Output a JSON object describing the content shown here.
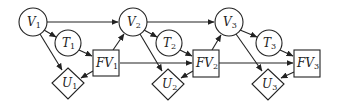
{
  "diagram": {
    "type": "dynamic-decision-network",
    "nodes": [
      {
        "id": "V1",
        "label": "V",
        "sub": "1",
        "shape": "circle",
        "x": 33,
        "y": 22
      },
      {
        "id": "T1",
        "label": "T",
        "sub": "1",
        "shape": "circle",
        "x": 68,
        "y": 43
      },
      {
        "id": "FV1",
        "label": "FV",
        "sub": "1",
        "shape": "square",
        "x": 106,
        "y": 63
      },
      {
        "id": "U1",
        "label": "U",
        "sub": "1",
        "shape": "diamond",
        "x": 68,
        "y": 83
      },
      {
        "id": "V2",
        "label": "V",
        "sub": "2",
        "shape": "circle",
        "x": 133,
        "y": 22
      },
      {
        "id": "T2",
        "label": "T",
        "sub": "2",
        "shape": "circle",
        "x": 169,
        "y": 43
      },
      {
        "id": "FV2",
        "label": "FV",
        "sub": "2",
        "shape": "square",
        "x": 205,
        "y": 63
      },
      {
        "id": "U2",
        "label": "U",
        "sub": "2",
        "shape": "diamond",
        "x": 168,
        "y": 84
      },
      {
        "id": "V3",
        "label": "V",
        "sub": "3",
        "shape": "circle",
        "x": 229,
        "y": 22
      },
      {
        "id": "T3",
        "label": "T",
        "sub": "3",
        "shape": "circle",
        "x": 269,
        "y": 43
      },
      {
        "id": "FV3",
        "label": "FV",
        "sub": "3",
        "shape": "square",
        "x": 307,
        "y": 63
      },
      {
        "id": "U3",
        "label": "U",
        "sub": "3",
        "shape": "diamond",
        "x": 268,
        "y": 84
      }
    ],
    "edges": [
      [
        "V1",
        "V2"
      ],
      [
        "V1",
        "T1"
      ],
      [
        "V1",
        "U1"
      ],
      [
        "T1",
        "FV1"
      ],
      [
        "FV1",
        "U1"
      ],
      [
        "FV1",
        "V2"
      ],
      [
        "FV1",
        "FV2"
      ],
      [
        "V2",
        "V3"
      ],
      [
        "V2",
        "T2"
      ],
      [
        "V2",
        "U2"
      ],
      [
        "T2",
        "FV2"
      ],
      [
        "FV2",
        "U2"
      ],
      [
        "FV2",
        "V3"
      ],
      [
        "FV2",
        "FV3"
      ],
      [
        "V3",
        "T3"
      ],
      [
        "V3",
        "U3"
      ],
      [
        "T3",
        "FV3"
      ],
      [
        "FV3",
        "U3"
      ]
    ]
  },
  "labels": {
    "V1": {
      "main": "V",
      "sub": "1"
    },
    "T1": {
      "main": "T",
      "sub": "1"
    },
    "FV1": {
      "main": "FV",
      "sub": "1"
    },
    "U1": {
      "main": "U",
      "sub": "1"
    },
    "V2": {
      "main": "V",
      "sub": "2"
    },
    "T2": {
      "main": "T",
      "sub": "2"
    },
    "FV2": {
      "main": "FV",
      "sub": "2"
    },
    "U2": {
      "main": "U",
      "sub": "2"
    },
    "V3": {
      "main": "V",
      "sub": "3"
    },
    "T3": {
      "main": "T",
      "sub": "3"
    },
    "FV3": {
      "main": "FV",
      "sub": "3"
    },
    "U3": {
      "main": "U",
      "sub": "3"
    }
  }
}
